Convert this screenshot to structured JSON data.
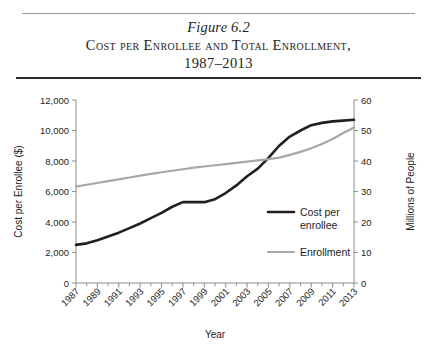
{
  "figure": {
    "number_label": "Figure 6.2",
    "title_line1": "Cost per Enrollee and Total Enrollment,",
    "title_line2": "1987–2013"
  },
  "chart_data": {
    "type": "line",
    "title": "Cost per Enrollee and Total Enrollment, 1987–2013",
    "xlabel": "Year",
    "ylabel": "Cost per Enrollee ($)",
    "y2label": "Millions of People",
    "xlim": [
      1987,
      2013
    ],
    "ylim": [
      0,
      12000
    ],
    "y2lim": [
      0,
      60
    ],
    "grid": false,
    "legend_position": "center-right",
    "x": [
      1987,
      1988,
      1989,
      1990,
      1991,
      1992,
      1993,
      1994,
      1995,
      1996,
      1997,
      1998,
      1999,
      2000,
      2001,
      2002,
      2003,
      2004,
      2005,
      2006,
      2007,
      2008,
      2009,
      2010,
      2011,
      2012,
      2013
    ],
    "xticks_major": [
      1987,
      1989,
      1991,
      1993,
      1995,
      1997,
      1999,
      2001,
      2003,
      2005,
      2007,
      2009,
      2011,
      2013
    ],
    "xticks_minor": [
      1988,
      1990,
      1992,
      1994,
      1996,
      1998,
      2000,
      2002,
      2004,
      2006,
      2008,
      2010,
      2012
    ],
    "yticks": [
      0,
      2000,
      4000,
      6000,
      8000,
      10000,
      12000
    ],
    "ytick_labels": [
      "0",
      "2,000",
      "4,000",
      "6,000",
      "8,000",
      "10,000",
      "12,000"
    ],
    "y2ticks": [
      0,
      10,
      20,
      30,
      40,
      50,
      60
    ],
    "y2tick_labels": [
      "0",
      "10",
      "20",
      "30",
      "40",
      "50",
      "60"
    ],
    "series": [
      {
        "name": "Cost per\nenrollee",
        "legend_label_line1": "Cost per",
        "legend_label_line2": "enrollee",
        "axis": "left",
        "color": "#231f20",
        "values": [
          2500,
          2600,
          2800,
          3050,
          3300,
          3600,
          3900,
          4250,
          4600,
          5000,
          5300,
          5300,
          5300,
          5500,
          5900,
          6400,
          7000,
          7500,
          8200,
          9000,
          9600,
          10000,
          10350,
          10500,
          10600,
          10650,
          10700
        ]
      },
      {
        "name": "Enrollment",
        "legend_label_line1": "Enrollment",
        "legend_label_line2": "",
        "axis": "right",
        "color": "#a7a7a7",
        "values": [
          31.6,
          32.2,
          32.8,
          33.4,
          34.0,
          34.6,
          35.2,
          35.8,
          36.3,
          36.8,
          37.3,
          37.8,
          38.2,
          38.6,
          39.0,
          39.4,
          39.8,
          40.2,
          40.6,
          41.1,
          42.0,
          43.0,
          44.2,
          45.6,
          47.2,
          49.2,
          51.0
        ]
      }
    ]
  }
}
